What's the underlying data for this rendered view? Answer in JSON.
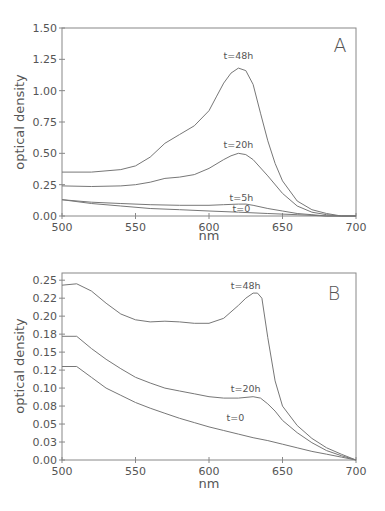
{
  "chart_data": [
    {
      "panel": "A",
      "type": "line",
      "title": "",
      "xlabel": "nm",
      "ylabel": "optical density",
      "xlim": [
        500,
        700
      ],
      "ylim": [
        0,
        1.5
      ],
      "x_ticks": [
        "500",
        "550",
        "600",
        "650",
        "700"
      ],
      "y_ticks": [
        "0.00",
        "0.25",
        "0.50",
        "0.75",
        "1.00",
        "1.25",
        "1.50"
      ],
      "grid": false,
      "legend": "inline curve labels",
      "series": [
        {
          "name": "t=48h",
          "x": [
            500,
            520,
            540,
            550,
            560,
            570,
            580,
            590,
            600,
            605,
            610,
            615,
            620,
            625,
            630,
            635,
            640,
            645,
            650,
            660,
            670,
            680,
            690,
            700
          ],
          "y": [
            0.35,
            0.35,
            0.37,
            0.4,
            0.47,
            0.58,
            0.65,
            0.72,
            0.84,
            0.95,
            1.06,
            1.14,
            1.18,
            1.16,
            1.05,
            0.82,
            0.6,
            0.42,
            0.28,
            0.12,
            0.05,
            0.02,
            0.0,
            0.0
          ]
        },
        {
          "name": "t=20h",
          "x": [
            500,
            520,
            540,
            550,
            560,
            570,
            580,
            590,
            600,
            610,
            615,
            620,
            625,
            630,
            640,
            650,
            660,
            670,
            680,
            690,
            700
          ],
          "y": [
            0.24,
            0.235,
            0.24,
            0.25,
            0.27,
            0.3,
            0.31,
            0.33,
            0.38,
            0.45,
            0.48,
            0.5,
            0.49,
            0.45,
            0.32,
            0.18,
            0.08,
            0.03,
            0.01,
            0.0,
            0.0
          ]
        },
        {
          "name": "t=5h",
          "x": [
            500,
            520,
            540,
            560,
            580,
            600,
            610,
            620,
            625,
            630,
            640,
            650,
            660,
            670,
            680,
            690,
            700
          ],
          "y": [
            0.13,
            0.11,
            0.1,
            0.09,
            0.085,
            0.085,
            0.09,
            0.095,
            0.095,
            0.085,
            0.06,
            0.04,
            0.02,
            0.01,
            0.0,
            0.0,
            0.0
          ]
        },
        {
          "name": "t=0",
          "x": [
            500,
            520,
            540,
            560,
            580,
            600,
            620,
            640,
            660,
            680,
            700
          ],
          "y": [
            0.13,
            0.1,
            0.08,
            0.06,
            0.05,
            0.04,
            0.03,
            0.02,
            0.01,
            0.0,
            0.0
          ]
        }
      ],
      "annotations": [
        "A",
        "t=48h",
        "t=20h",
        "t=5h",
        "t=0"
      ]
    },
    {
      "panel": "B",
      "type": "line",
      "title": "",
      "xlabel": "nm",
      "ylabel": "optical density",
      "xlim": [
        500,
        700
      ],
      "ylim": [
        0,
        0.26
      ],
      "x_ticks": [
        "500",
        "550",
        "600",
        "650",
        "700"
      ],
      "y_ticks": [
        "0.00",
        "0.03",
        "0.05",
        "0.08",
        "0.10",
        "0.12",
        "0.15",
        "0.18",
        "0.20",
        "0.22",
        "0.25"
      ],
      "grid": false,
      "legend": "inline curve labels",
      "series": [
        {
          "name": "t=48h",
          "x": [
            500,
            510,
            520,
            530,
            540,
            550,
            560,
            570,
            580,
            590,
            600,
            610,
            620,
            625,
            630,
            633,
            636,
            640,
            645,
            650,
            660,
            670,
            680,
            690,
            700
          ],
          "y": [
            0.243,
            0.245,
            0.235,
            0.218,
            0.203,
            0.195,
            0.192,
            0.193,
            0.192,
            0.19,
            0.19,
            0.197,
            0.215,
            0.225,
            0.232,
            0.232,
            0.225,
            0.17,
            0.11,
            0.075,
            0.048,
            0.03,
            0.017,
            0.008,
            0.0
          ]
        },
        {
          "name": "t=20h",
          "x": [
            500,
            510,
            520,
            530,
            540,
            550,
            560,
            570,
            580,
            590,
            600,
            610,
            620,
            630,
            635,
            640,
            645,
            650,
            660,
            670,
            680,
            690,
            700
          ],
          "y": [
            0.172,
            0.172,
            0.155,
            0.14,
            0.127,
            0.115,
            0.107,
            0.1,
            0.096,
            0.092,
            0.088,
            0.086,
            0.086,
            0.088,
            0.086,
            0.078,
            0.068,
            0.055,
            0.038,
            0.024,
            0.013,
            0.006,
            0.0
          ]
        },
        {
          "name": "t=0",
          "x": [
            500,
            510,
            520,
            530,
            540,
            550,
            560,
            570,
            580,
            590,
            600,
            610,
            620,
            630,
            640,
            650,
            660,
            670,
            680,
            690,
            700
          ],
          "y": [
            0.13,
            0.13,
            0.115,
            0.1,
            0.09,
            0.08,
            0.072,
            0.065,
            0.058,
            0.052,
            0.046,
            0.041,
            0.036,
            0.031,
            0.027,
            0.022,
            0.017,
            0.012,
            0.008,
            0.004,
            0.0
          ]
        }
      ],
      "annotations": [
        "B",
        "t=48h",
        "t=20h",
        "t=0"
      ]
    }
  ],
  "figure": {
    "panels": [
      {
        "letter": "A",
        "xlabel": "nm",
        "ylabel": "optical density",
        "labels": [
          {
            "text": "t=48h",
            "x": 620,
            "y": 1.25
          },
          {
            "text": "t=20h",
            "x": 620,
            "y": 0.54
          },
          {
            "text": "t=5h",
            "x": 622,
            "y": 0.12
          },
          {
            "text": "t=0",
            "x": 622,
            "y": 0.035
          }
        ]
      },
      {
        "letter": "B",
        "xlabel": "nm",
        "ylabel": "optical density",
        "labels": [
          {
            "text": "t=48h",
            "x": 625,
            "y": 0.238
          },
          {
            "text": "t=20h",
            "x": 625,
            "y": 0.094
          },
          {
            "text": "t=0",
            "x": 618,
            "y": 0.054
          }
        ]
      }
    ],
    "line_color": "#777777",
    "axis_color": "#888888",
    "text_color": "#555555"
  }
}
